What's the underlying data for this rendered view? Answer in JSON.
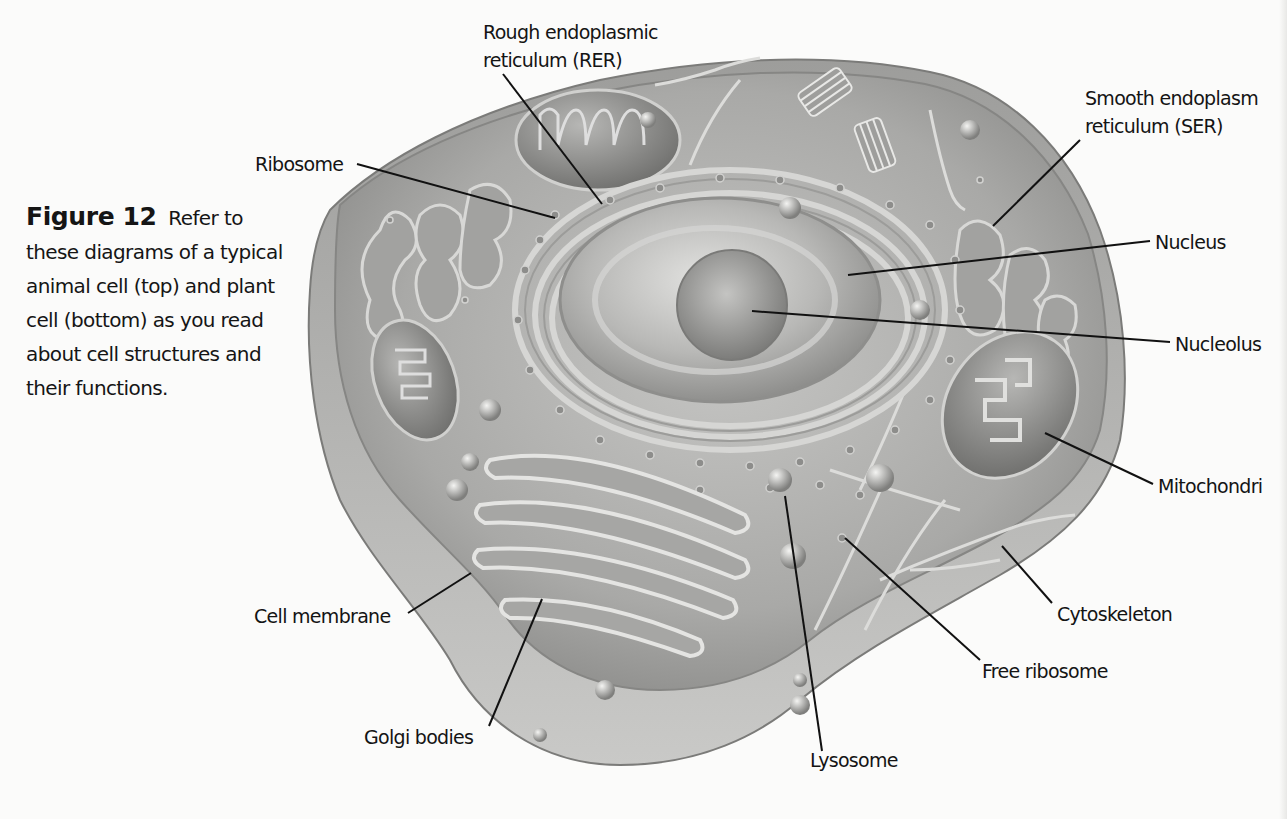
{
  "figure": {
    "number_label": "Figure 12",
    "caption": "Refer to these diagrams of a typical animal cell (top) and plant cell (bottom) as you read about cell structures and their functions."
  },
  "labels": {
    "rer": {
      "line1": "Rough endoplasmic",
      "line2": "reticulum (RER)"
    },
    "ribosome": "Ribosome",
    "ser": {
      "line1": "Smooth endoplasm",
      "line2": "reticulum (SER)"
    },
    "nucleus": "Nucleus",
    "nucleolus": "Nucleolus",
    "mitochondria": "Mitochondri",
    "cytoskeleton": "Cytoskeleton",
    "free_ribosome": "Free ribosome",
    "lysosome": "Lysosome",
    "golgi": "Golgi bodies",
    "cell_membrane": "Cell membrane"
  },
  "colors": {
    "background": "#fbfbfa",
    "cell_outer": "#8d8d8b",
    "cytoplasm": "#b3b3b1",
    "organelle": "#9a9a98",
    "nucleus": "#bdbdbb",
    "nucleolus": "#8e8e8c",
    "leader_line": "#111111",
    "text": "#141414"
  }
}
